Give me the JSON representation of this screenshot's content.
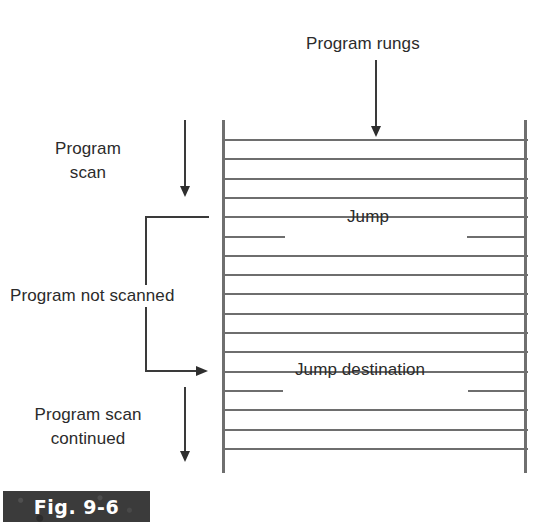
{
  "figure": {
    "caption": "Fig. 9-6",
    "background": "#ffffff",
    "line_color": "#6e6e6e",
    "arrow_color": "#2e2e2e",
    "plate_color": "#3b3b3b",
    "plate_text_color": "#ffffff"
  },
  "annotations": {
    "program_rungs": "Program rungs",
    "program_scan_line1": "Program",
    "program_scan_line2": "scan",
    "program_not_scanned": "Program not scanned",
    "program_scan_continued_line1": "Program scan",
    "program_scan_continued_line2": "continued"
  },
  "ladder": {
    "left_rail_x": 222,
    "right_rail_x": 525,
    "top_y": 120,
    "bottom_y": 473,
    "rung_count": 17,
    "rung_spacing": 19.3,
    "first_rung_y": 139,
    "labeled_rungs": [
      {
        "index": 5,
        "label": "Jump",
        "y": 217
      },
      {
        "index": 13,
        "label": "Jump destination",
        "y": 370
      }
    ]
  },
  "chart_data": {
    "type": "diagram",
    "title": "Fig. 9-6",
    "elements": [
      {
        "name": "program-rungs-label",
        "text": "Program rungs",
        "kind": "label"
      },
      {
        "name": "program-rungs-arrow",
        "kind": "arrow",
        "direction": "down",
        "from": [
          376,
          60
        ],
        "to": [
          376,
          137
        ]
      },
      {
        "name": "program-scan-label",
        "text": "Program scan",
        "kind": "label"
      },
      {
        "name": "program-scan-arrow",
        "kind": "arrow",
        "direction": "down",
        "from": [
          185,
          120
        ],
        "to": [
          185,
          198
        ]
      },
      {
        "name": "jump-rung",
        "text": "Jump",
        "kind": "rung",
        "y": 217
      },
      {
        "name": "skip-bracket",
        "kind": "bracket",
        "top_y": 216,
        "bottom_y": 371,
        "left_x": 145
      },
      {
        "name": "program-not-scanned-label",
        "text": "Program not scanned",
        "kind": "label"
      },
      {
        "name": "jump-destination-rung",
        "text": "Jump destination",
        "kind": "rung",
        "y": 370
      },
      {
        "name": "jump-arrow",
        "kind": "arrow",
        "direction": "right",
        "from": [
          145,
          371
        ],
        "to": [
          210,
          371
        ]
      },
      {
        "name": "program-scan-continued-label",
        "text": "Program scan continued",
        "kind": "label"
      },
      {
        "name": "program-scan-continued-arrow",
        "kind": "arrow",
        "direction": "down",
        "from": [
          185,
          387
        ],
        "to": [
          185,
          463
        ]
      }
    ]
  }
}
